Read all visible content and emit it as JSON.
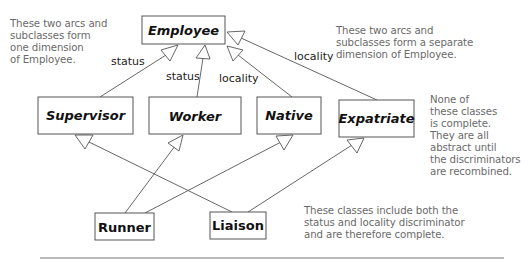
{
  "classes": {
    "employee": {
      "label": "Employee",
      "abstract": true,
      "x": 142,
      "y": 16,
      "w": 83,
      "h": 28
    },
    "supervisor": {
      "label": "Supervisor",
      "abstract": true,
      "x": 38,
      "y": 97,
      "w": 95,
      "h": 37
    },
    "worker": {
      "label": "Worker",
      "abstract": true,
      "x": 149,
      "y": 97,
      "w": 92,
      "h": 37
    },
    "native": {
      "label": "Native",
      "abstract": true,
      "x": 257,
      "y": 97,
      "w": 64,
      "h": 37
    },
    "expatriate": {
      "label": "Expatriate",
      "abstract": true,
      "x": 339,
      "y": 100,
      "w": 75,
      "h": 37
    },
    "runner": {
      "label": "Runner",
      "abstract": false,
      "x": 95,
      "y": 213,
      "w": 59,
      "h": 27
    },
    "liaison": {
      "label": "Liaison",
      "abstract": false,
      "x": 210,
      "y": 212,
      "w": 56,
      "h": 27
    }
  },
  "discriminators": {
    "status_left": "status",
    "status_mid": "status",
    "locality_mid": "locality",
    "locality_right": "locality"
  },
  "generalizations": [
    {
      "from": "supervisor",
      "to": "employee",
      "discriminator": "status"
    },
    {
      "from": "worker",
      "to": "employee",
      "discriminator": "status"
    },
    {
      "from": "native",
      "to": "employee",
      "discriminator": "locality"
    },
    {
      "from": "expatriate",
      "to": "employee",
      "discriminator": "locality"
    },
    {
      "from": "runner",
      "to": "worker"
    },
    {
      "from": "runner",
      "to": "native"
    },
    {
      "from": "liaison",
      "to": "supervisor"
    },
    {
      "from": "liaison",
      "to": "expatriate"
    }
  ],
  "notes": {
    "left": [
      "These two arcs and",
      "subclasses form",
      "one dimension",
      "of Employee."
    ],
    "top_right": [
      "These two arcs and",
      "subclasses form a separate",
      "dimension of Employee."
    ],
    "right": [
      "None of",
      "these classes",
      "is complete.",
      "They are all",
      "abstract until",
      "the discriminators",
      "are recombined."
    ],
    "bottom": [
      "These classes include both the",
      "status and locality discriminator",
      "and are therefore complete."
    ]
  },
  "colors": {
    "line": "#555555",
    "note_text": "#6a6a6a",
    "class_text": "#111111"
  }
}
